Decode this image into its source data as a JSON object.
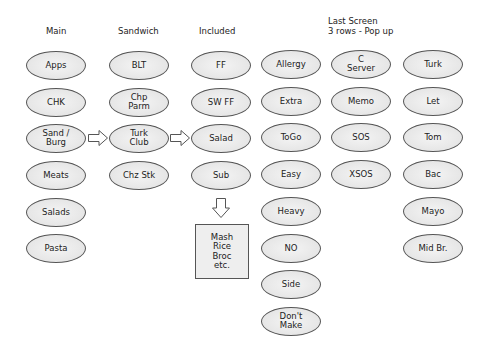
{
  "headers": {
    "main": "Main",
    "sandwich": "Sandwich",
    "included": "Included",
    "last_screen": "Last Screen\n3 rows - Pop up"
  },
  "columns": {
    "main": [
      "Apps",
      "CHK",
      "Sand /\nBurg",
      "Meats",
      "Salads",
      "Pasta"
    ],
    "sandwich": [
      "BLT",
      "Chp\nParm",
      "Turk\nClub",
      "Chz Stk"
    ],
    "included": [
      "FF",
      "SW FF",
      "Salad",
      "Sub"
    ],
    "modifiers": [
      "Allergy",
      "Extra",
      "ToGo",
      "Easy",
      "Heavy",
      "NO",
      "Side",
      "Don't\nMake"
    ],
    "last_screen": [
      "C\nServer",
      "Memo",
      "SOS",
      "XSOS"
    ],
    "toppings": [
      "Turk",
      "Let",
      "Tom",
      "Bac",
      "Mayo",
      "Mid Br."
    ]
  },
  "sides_box": "Mash\nRice\nBroc\netc.",
  "icons": {
    "arrow_main_to_sandwich": "right-block-arrow",
    "arrow_sandwich_to_included": "right-block-arrow",
    "arrow_included_to_sides": "down-block-arrow"
  }
}
